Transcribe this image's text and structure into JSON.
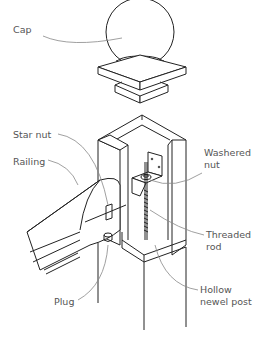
{
  "diagram": {
    "labels": {
      "cap": "Cap",
      "star_nut": "Star nut",
      "railing": "Railing",
      "washered_nut_line1": "Washered",
      "washered_nut_line2": "nut",
      "threaded_rod_line1": "Threaded",
      "threaded_rod_line2": "rod",
      "plug": "Plug",
      "hollow_newel_post_line1": "Hollow",
      "hollow_newel_post_line2": "newel post"
    },
    "colors": {
      "line": "#222222",
      "leader": "#888888",
      "label_text": "#555555",
      "background": "#ffffff"
    }
  }
}
